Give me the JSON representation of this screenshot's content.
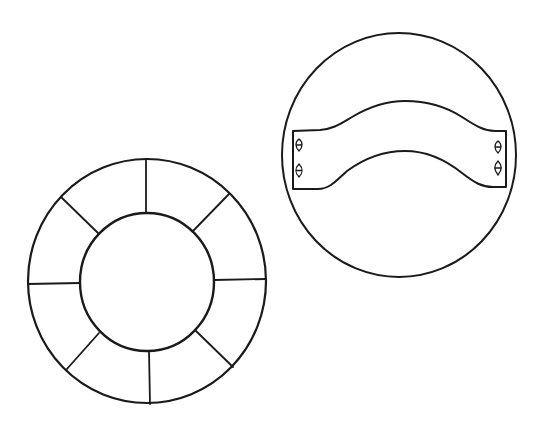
{
  "figure": {
    "width": 554,
    "height": 424,
    "background": "#ffffff",
    "ink_color": "#1a1a1a",
    "panels": [
      {
        "name": "segmented-ring",
        "description": "Outer circle with inner circle, ring divided into 8 segments by radial spokes",
        "outer_circle": {
          "cx": 147,
          "cy": 281,
          "rx": 119,
          "ry": 122
        },
        "inner_circle": {
          "cx": 147,
          "cy": 282,
          "rx": 67,
          "ry": 69
        },
        "segments": 8
      },
      {
        "name": "curved-strap",
        "description": "Circle containing a curved band/strap with two lens-shaped slots at each end",
        "outer_circle": {
          "cx": 399,
          "cy": 155,
          "rx": 117,
          "ry": 122
        },
        "slots_per_end": 2
      }
    ]
  }
}
